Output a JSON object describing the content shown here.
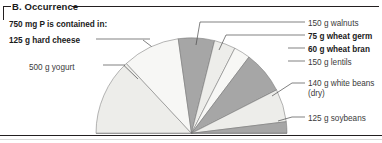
{
  "panel": {
    "title": "B. Occurrence",
    "intro": "750 mg P is contained in:"
  },
  "labels": {
    "hard_cheese": "125 g hard cheese",
    "yogurt": "500 g yogurt",
    "walnuts": "150 g walnuts",
    "wheat_germ": "75 g wheat germ",
    "wheat_bran": "60 g wheat bran",
    "lentils": "150 g lentils",
    "white_beans": "140 g white beans (dry)",
    "soybeans": "125 g soybeans"
  },
  "colors": {
    "light": "#ededea",
    "lighter": "#f7f7f5",
    "medium": "#a6a6a6",
    "outline": "#6f6f6f",
    "ink": "#231f20"
  },
  "chart_data": {
    "type": "pie",
    "title": "B. Occurrence",
    "subtitle": "750 mg P is contained in:",
    "shape": "semicircle",
    "units": "degrees of 180° half-pie",
    "categories": [
      "125 g hard cheese",
      "500 g yogurt",
      "150 g walnuts",
      "75 g wheat germ",
      "60 g wheat bran",
      "150 g lentils",
      "140 g white beans (dry)",
      "125 g soybeans"
    ],
    "values": [
      47,
      35,
      22,
      13,
      10,
      26,
      20,
      7
    ],
    "slice_fills": [
      "#ededea",
      "#f7f7f5",
      "#a6a6a6",
      "#ededea",
      "#f7f7f5",
      "#a6a6a6",
      "#ededea",
      "#a6a6a6"
    ],
    "amounts_g": [
      125,
      500,
      150,
      75,
      60,
      150,
      140,
      125
    ],
    "foods": [
      "hard cheese",
      "yogurt",
      "walnuts",
      "wheat germ",
      "wheat bran",
      "lentils",
      "white beans (dry)",
      "soybeans"
    ],
    "phosphorus_mg_each": 750,
    "legend": "none (direct labels with leader lines)",
    "grid": false,
    "xlabel": "",
    "ylabel": ""
  }
}
